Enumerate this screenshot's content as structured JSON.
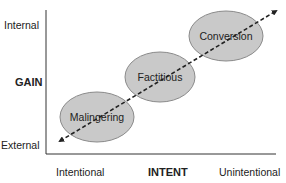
{
  "y_axis": {
    "title": "GAIN",
    "top_label": "Internal",
    "bottom_label": "External"
  },
  "x_axis": {
    "title": "INTENT",
    "left_label": "Intentional",
    "right_label": "Unintentional"
  },
  "regions": [
    {
      "label": "Malingering",
      "cx": 97,
      "cy": 117,
      "rx": 37,
      "ry": 25
    },
    {
      "label": "Factitious",
      "cx": 160,
      "cy": 77,
      "rx": 35,
      "ry": 25
    },
    {
      "label": "Conversion",
      "cx": 226,
      "cy": 36,
      "rx": 37,
      "ry": 25
    }
  ],
  "arrow": {
    "style": "dashed",
    "bidirectional": true,
    "from": [
      60,
      141
    ],
    "to": [
      276,
      11
    ]
  },
  "colors": {
    "ellipse_fill": "#c9c9c9",
    "ellipse_stroke": "#8a8a8a",
    "axis": "#333333",
    "arrow": "#222222",
    "text": "#222222"
  }
}
